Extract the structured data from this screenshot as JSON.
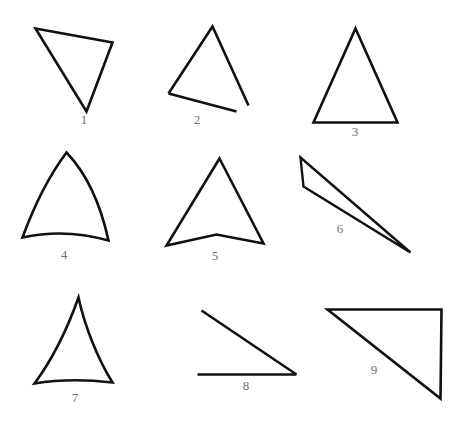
{
  "canvas": {
    "width": 463,
    "height": 425,
    "background": "#ffffff",
    "stroke_color": "#111111",
    "label_color": "#6f6f6f"
  },
  "figures": [
    {
      "id": "figure-1",
      "label": "1",
      "label_x": 84,
      "label_y": 119,
      "description": "closed downward-pointing scalene triangle",
      "closed": true,
      "stroke_width": 2.6,
      "path": "M35.5,28.5 L112.5,42.5 L86.5,111.5 Z"
    },
    {
      "id": "figure-2",
      "label": "2",
      "label_x": 197,
      "label_y": 119,
      "description": "open triangle, base does not meet right vertex",
      "closed": false,
      "stroke_width": 2.6,
      "path": "M168.5,93.5 L212.5,26.5 L248.5,105.5 M168.5,93.5 L236.5,111.5"
    },
    {
      "id": "figure-3",
      "label": "3",
      "label_x": 355,
      "label_y": 131,
      "description": "closed isosceles triangle, flat base",
      "closed": true,
      "stroke_width": 2.6,
      "path": "M355.5,28.5 L397.5,122.5 L313.5,122.5 Z"
    },
    {
      "id": "figure-4",
      "label": "4",
      "label_x": 64,
      "label_y": 254,
      "description": "triangle with outward bulging curved sides",
      "closed": true,
      "stroke_width": 2.6,
      "path": "M66.5,152.5 C88.5,175.5 101.5,208.5 108.5,240.5 C80.5,232.5 49.5,231.5 22.5,237.5 C33.5,207.5 48.5,176.5 66.5,152.5 Z"
    },
    {
      "id": "figure-5",
      "label": "5",
      "label_x": 215,
      "label_y": 255,
      "description": "concave arrow-like quadrilateral with notched base",
      "closed": true,
      "stroke_width": 2.6,
      "path": "M219.5,158.5 L263.5,243.5 L216.5,234.5 L166.5,245.5 Z"
    },
    {
      "id": "figure-6",
      "label": "6",
      "label_x": 340,
      "label_y": 228,
      "description": "extremely thin sliver triangle pointing down-right",
      "closed": true,
      "stroke_width": 2.4,
      "path": "M300.5,157.5 L410.5,252.5 L303.5,186.5 Z"
    },
    {
      "id": "figure-7",
      "label": "7",
      "label_x": 75,
      "label_y": 397,
      "description": "triangle with slightly inward curved sides",
      "closed": true,
      "stroke_width": 2.6,
      "path": "M78.5,297.5 C84.5,325.5 97.5,358.5 112.5,382.5 C86.5,379.5 58.5,379.5 34.5,383.5 C51.5,360.5 67.5,328.5 78.5,297.5 Z"
    },
    {
      "id": "figure-8",
      "label": "8",
      "label_x": 246,
      "label_y": 385,
      "description": "open right triangle, missing vertical side",
      "closed": false,
      "stroke_width": 2.6,
      "path": "M201.5,310.5 L296.5,374.5 M197.5,374.5 L296.5,374.5"
    },
    {
      "id": "figure-9",
      "label": "9",
      "label_x": 374,
      "label_y": 369,
      "description": "closed right triangle with right angle at top-right",
      "closed": true,
      "stroke_width": 2.6,
      "path": "M327.5,309.5 L441.5,309.5 L440.5,398.5 Z"
    }
  ]
}
